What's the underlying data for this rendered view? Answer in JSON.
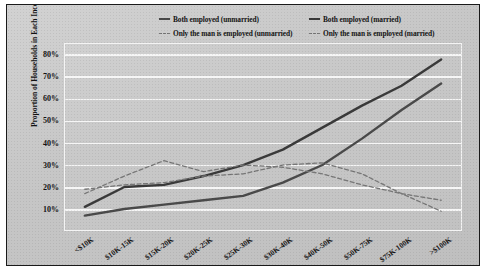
{
  "figure": {
    "background_color": "#c9c9c9",
    "border_color": "#1a1a1a",
    "plot_border_color": "#f4f4f4"
  },
  "legend": {
    "position": "top",
    "entries": [
      {
        "label": "Both employed (unmarried)",
        "style": "solid",
        "color": "#4a4a4a",
        "icon": "line-solid-icon"
      },
      {
        "label": "Both employed (married)",
        "style": "solid",
        "color": "#3a3a3a",
        "icon": "line-solid-icon"
      },
      {
        "label": "Only the man is employed (unmarried)",
        "style": "dashed",
        "color": "#777777",
        "icon": "line-dashed-icon"
      },
      {
        "label": "Only the man is employed (married)",
        "style": "dashed",
        "color": "#777777",
        "icon": "line-dashed-icon"
      }
    ]
  },
  "axes": {
    "ylabel": "Proportion of Households in Each Income Bracket",
    "yticks": [
      "80%",
      "70%",
      "60%",
      "50%",
      "40%",
      "30%",
      "20%",
      "10%"
    ],
    "xticks": [
      "<$10K",
      "$10K-15K",
      "$15K-20K",
      "$20K-25K",
      "$25K-30K",
      "$30K-40K",
      "$40K-50K",
      "$50K-75K",
      "$75K-100K",
      ">$100K"
    ]
  },
  "chart_data": {
    "type": "line",
    "title": "",
    "xlabel": "",
    "ylabel": "Proportion of Households in Each Income Bracket",
    "categories": [
      "<$10K",
      "$10K-15K",
      "$15K-20K",
      "$20K-25K",
      "$25K-30K",
      "$30K-40K",
      "$40K-50K",
      "$50K-75K",
      "$75K-100K",
      ">$100K"
    ],
    "ylim": [
      0,
      85
    ],
    "yticks": [
      10,
      20,
      30,
      40,
      50,
      60,
      70,
      80
    ],
    "ytick_format": "percent",
    "grid": true,
    "legend_position": "top",
    "series": [
      {
        "name": "Both employed (married)",
        "style": "solid",
        "color": "#3a3a3a",
        "values": [
          11,
          20,
          21,
          25,
          30,
          37,
          47,
          57,
          66,
          78
        ]
      },
      {
        "name": "Both employed (unmarried)",
        "style": "solid",
        "color": "#4a4a4a",
        "values": [
          7,
          10,
          12,
          14,
          16,
          22,
          30,
          42,
          55,
          67
        ]
      },
      {
        "name": "Only the man is employed (unmarried)",
        "style": "dashed",
        "color": "#777777",
        "values": [
          17,
          25,
          32,
          27,
          30,
          29,
          26,
          21,
          17,
          14
        ]
      },
      {
        "name": "Only the man is employed (married)",
        "style": "dashed",
        "color": "#777777",
        "values": [
          19,
          21,
          22,
          25,
          26,
          30,
          31,
          26,
          17,
          9
        ]
      }
    ]
  }
}
